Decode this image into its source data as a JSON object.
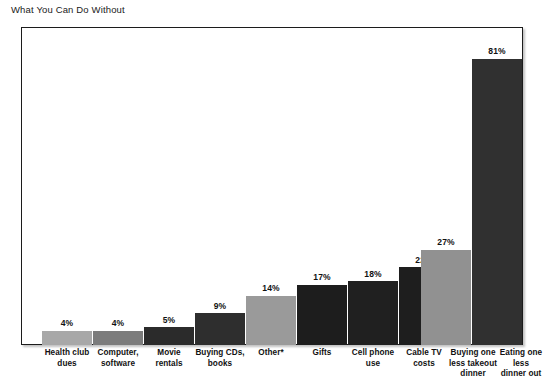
{
  "chart": {
    "title": "What You Can Do Without",
    "footnote": ""
  },
  "chart_data": {
    "type": "bar",
    "title": "What You Can Do Without",
    "xlabel": "",
    "ylabel": "",
    "ylim": [
      0,
      90
    ],
    "grid": false,
    "legend": "none",
    "value_suffix": "%",
    "categories": [
      "Health club dues",
      "Computer, software",
      "Movie rentals",
      "Buying CDs, books",
      "Other*",
      "Gifts",
      "Cell phone use",
      "Cable TV costs",
      "Buying one less takeout dinner",
      "Eating one less dinner out"
    ],
    "category_lines": [
      [
        "Health club",
        "dues"
      ],
      [
        "Computer,",
        "software"
      ],
      [
        "Movie",
        "rentals"
      ],
      [
        "Buying CDs,",
        "books"
      ],
      [
        "Other*"
      ],
      [
        "Gifts"
      ],
      [
        "Cell phone",
        "use"
      ],
      [
        "Cable TV",
        "costs"
      ],
      [
        "Buying one",
        "less takeout",
        "dinner"
      ],
      [
        "Eating one",
        "less",
        "dinner out"
      ]
    ],
    "values": [
      4,
      4,
      5,
      9,
      14,
      17,
      18,
      22,
      27,
      81
    ],
    "value_labels": [
      "4%",
      "4%",
      "5%",
      "9%",
      "14%",
      "17%",
      "18%",
      "22%",
      "27%",
      "81%"
    ],
    "colors": [
      "#a8a8a8",
      "#7c7c7c",
      "#2b2b2b",
      "#2e2e2e",
      "#9a9a9a",
      "#1d1d1d",
      "#202020",
      "#1e1e1e",
      "#919191",
      "#303030"
    ]
  }
}
